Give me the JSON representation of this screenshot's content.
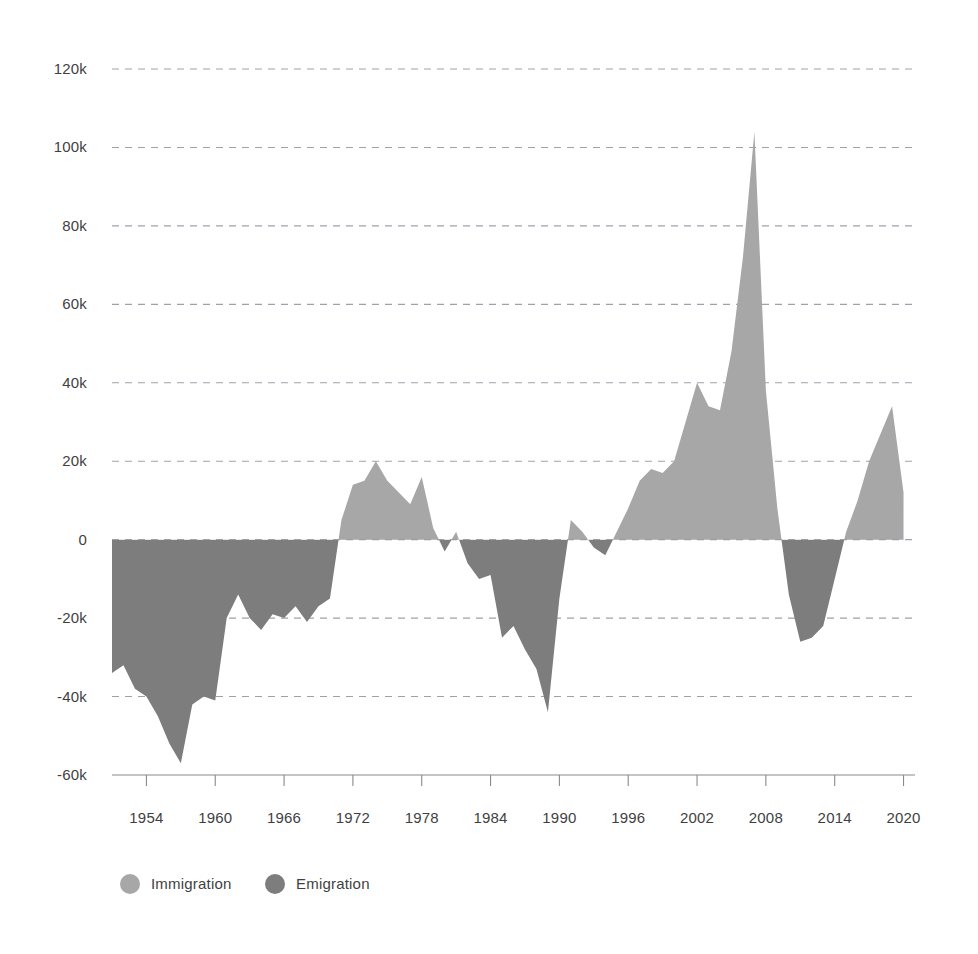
{
  "chart_data": {
    "type": "area",
    "title": "",
    "subtitle": "",
    "xlabel": "",
    "ylabel": "",
    "xlim": [
      1951,
      2021
    ],
    "ylim": [
      -60000,
      120000
    ],
    "grid": true,
    "legend_position": "bottom-left",
    "y_ticks": [
      {
        "value": 120000,
        "label": "120k"
      },
      {
        "value": 100000,
        "label": "100k"
      },
      {
        "value": 80000,
        "label": "80k"
      },
      {
        "value": 60000,
        "label": "60k"
      },
      {
        "value": 40000,
        "label": "40k"
      },
      {
        "value": 20000,
        "label": "20k"
      },
      {
        "value": 0,
        "label": "0"
      },
      {
        "value": -20000,
        "label": "-20k"
      },
      {
        "value": -40000,
        "label": "-40k"
      },
      {
        "value": -60000,
        "label": "-60k"
      }
    ],
    "x_ticks": [
      {
        "value": 1954,
        "label": "1954"
      },
      {
        "value": 1960,
        "label": "1960"
      },
      {
        "value": 1966,
        "label": "1966"
      },
      {
        "value": 1972,
        "label": "1972"
      },
      {
        "value": 1978,
        "label": "1978"
      },
      {
        "value": 1984,
        "label": "1984"
      },
      {
        "value": 1990,
        "label": "1990"
      },
      {
        "value": 1996,
        "label": "1996"
      },
      {
        "value": 2002,
        "label": "2002"
      },
      {
        "value": 2008,
        "label": "2008"
      },
      {
        "value": 2014,
        "label": "2014"
      },
      {
        "value": 2020,
        "label": "2020"
      }
    ],
    "series": [
      {
        "name": "Net migration",
        "description": "Positive values filled as Immigration, negative values filled as Emigration",
        "x": [
          1951,
          1952,
          1953,
          1954,
          1955,
          1956,
          1957,
          1958,
          1959,
          1960,
          1961,
          1962,
          1963,
          1964,
          1965,
          1966,
          1967,
          1968,
          1969,
          1970,
          1971,
          1972,
          1973,
          1974,
          1975,
          1976,
          1977,
          1978,
          1979,
          1980,
          1981,
          1982,
          1983,
          1984,
          1985,
          1986,
          1987,
          1988,
          1989,
          1990,
          1991,
          1992,
          1993,
          1994,
          1995,
          1996,
          1997,
          1998,
          1999,
          2000,
          2001,
          2002,
          2003,
          2004,
          2005,
          2006,
          2007,
          2008,
          2009,
          2010,
          2011,
          2012,
          2013,
          2014,
          2015,
          2016,
          2017,
          2018,
          2019,
          2020
        ],
        "y": [
          -34000,
          -32000,
          -38000,
          -40000,
          -45000,
          -52000,
          -57000,
          -42000,
          -40000,
          -41000,
          -20000,
          -14000,
          -20000,
          -23000,
          -19000,
          -20000,
          -17000,
          -21000,
          -17000,
          -15000,
          5000,
          14000,
          15000,
          20000,
          15000,
          12000,
          9000,
          16000,
          3000,
          -3000,
          2000,
          -6000,
          -10000,
          -9000,
          -25000,
          -22000,
          -28000,
          -33000,
          -44000,
          -15000,
          5000,
          2000,
          -2000,
          -4000,
          2000,
          8000,
          15000,
          18000,
          17000,
          20000,
          30000,
          40000,
          34000,
          33000,
          48000,
          72000,
          104000,
          38000,
          8000,
          -14000,
          -26000,
          -25000,
          -22000,
          -10000,
          2000,
          10000,
          20000,
          27000,
          34000,
          12000
        ]
      }
    ],
    "legend": [
      {
        "label": "Immigration",
        "color": "#a7a7a7",
        "marker": "circle"
      },
      {
        "label": "Emigration",
        "color": "#7d7d7d",
        "marker": "circle"
      }
    ],
    "colors": {
      "positive_fill": "#a7a7a7",
      "negative_fill": "#7d7d7d",
      "gridline": "#9aa4ae",
      "axis": "#8a8a8a",
      "text": "#3f3f3f",
      "background": "#ffffff"
    }
  },
  "legend": {
    "items": [
      {
        "label": "Immigration"
      },
      {
        "label": "Emigration"
      }
    ]
  }
}
